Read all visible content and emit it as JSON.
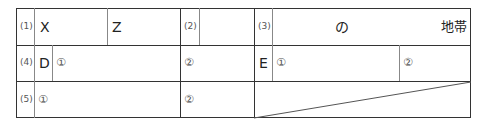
{
  "form": {
    "row1": {
      "q1_label": "(1)",
      "q1_field_a": "X",
      "q1_field_b": "Z",
      "q2_label": "(2)",
      "q3_label": "(3)",
      "q3_middle_text": "の",
      "q3_suffix_text": "地帯"
    },
    "row2": {
      "q4_label": "(4)",
      "d_label": "D",
      "d_sub1": "①",
      "d_sub2": "②",
      "e_label": "E",
      "e_sub1": "①",
      "e_sub2": "②"
    },
    "row3": {
      "q5_label": "(5)",
      "sub1": "①",
      "sub2": "②"
    }
  }
}
